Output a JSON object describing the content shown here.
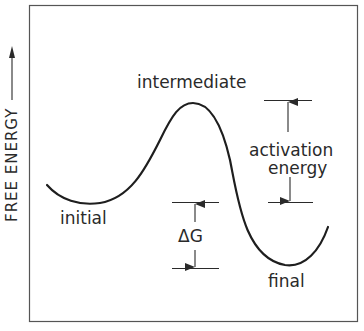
{
  "diagram": {
    "type": "free-energy-reaction-profile",
    "y_axis_label": "FREE ENERGY",
    "y_axis_direction": "up",
    "labels": {
      "initial": "initial",
      "intermediate": "intermediate",
      "final": "final",
      "activation_energy_line1": "activation",
      "activation_energy_line2": "energy",
      "delta_g": "ΔG"
    },
    "colors": {
      "ink": "#2a2a2a",
      "background": "#ffffff"
    }
  }
}
